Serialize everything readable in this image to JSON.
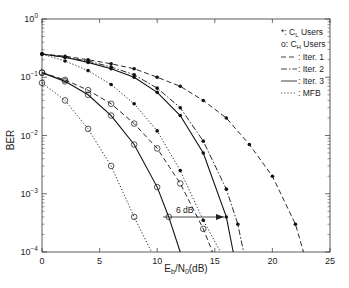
{
  "chart_data": {
    "type": "line",
    "title": "",
    "xlabel": "Eb/N0(dB)",
    "ylabel": "BER",
    "xlim": [
      0,
      25
    ],
    "ylim": [
      0.0001,
      1
    ],
    "yscale": "log",
    "x_ticks": [
      "0",
      "5",
      "10",
      "15",
      "20",
      "25"
    ],
    "y_ticks": [
      "10^0",
      "10^-1",
      "10^-2",
      "10^-3",
      "10^-4"
    ],
    "legend": [
      {
        "label": "*: C_L Users",
        "marker": "*"
      },
      {
        "label": "o: C_H Users",
        "marker": "o"
      },
      {
        "label": ": Iter. 1",
        "style": "dashed"
      },
      {
        "label": ": Iter. 2",
        "style": "dashdot"
      },
      {
        "label": ": Iter. 3",
        "style": "solid"
      },
      {
        "label": ": MFB",
        "style": "dotted"
      }
    ],
    "annotation": {
      "text": "6 dB",
      "from_x": 10.5,
      "to_x": 15.5,
      "y": 0.00025
    },
    "series": [
      {
        "name": "C_L Iter. 1",
        "marker": "*",
        "style": "dashed",
        "x": [
          0,
          2,
          4,
          6,
          8,
          10,
          12,
          14,
          16,
          18,
          20,
          22,
          22.7
        ],
        "y": [
          0.25,
          0.23,
          0.2,
          0.17,
          0.14,
          0.1,
          0.07,
          0.04,
          0.02,
          0.007,
          0.002,
          0.0003,
          0.0001
        ]
      },
      {
        "name": "C_L Iter. 2",
        "marker": "*",
        "style": "dashdot",
        "x": [
          0,
          2,
          4,
          6,
          8,
          10,
          12,
          14,
          16,
          17,
          17.5
        ],
        "y": [
          0.25,
          0.22,
          0.19,
          0.15,
          0.11,
          0.065,
          0.03,
          0.008,
          0.0012,
          0.0003,
          0.0001
        ]
      },
      {
        "name": "C_L Iter. 3",
        "marker": "*",
        "style": "solid",
        "x": [
          0,
          2,
          4,
          6,
          8,
          10,
          12,
          14,
          16,
          16.6
        ],
        "y": [
          0.25,
          0.22,
          0.18,
          0.14,
          0.1,
          0.055,
          0.022,
          0.005,
          0.0004,
          0.0001
        ]
      },
      {
        "name": "C_L MFB",
        "marker": "*",
        "style": "dotted",
        "x": [
          0,
          2,
          4,
          6,
          8,
          10,
          12,
          14,
          15.5
        ],
        "y": [
          0.25,
          0.19,
          0.13,
          0.075,
          0.035,
          0.012,
          0.0025,
          0.00035,
          0.0001
        ]
      },
      {
        "name": "C_H Iter. 1",
        "marker": "o",
        "style": "dashed",
        "x": [
          0,
          2,
          4,
          6,
          8,
          10,
          12,
          14,
          14.8
        ],
        "y": [
          0.12,
          0.09,
          0.06,
          0.035,
          0.016,
          0.006,
          0.0015,
          0.00025,
          0.0001
        ]
      },
      {
        "name": "C_H Iter. 3",
        "marker": "o",
        "style": "solid",
        "x": [
          0,
          2,
          4,
          6,
          8,
          10,
          11,
          12
        ],
        "y": [
          0.12,
          0.085,
          0.05,
          0.022,
          0.007,
          0.0013,
          0.0004,
          0.0001
        ]
      },
      {
        "name": "C_H MFB",
        "marker": "o",
        "style": "dotted",
        "x": [
          0,
          2,
          4,
          6,
          8,
          9.5
        ],
        "y": [
          0.08,
          0.04,
          0.013,
          0.003,
          0.0004,
          0.0001
        ]
      }
    ]
  }
}
